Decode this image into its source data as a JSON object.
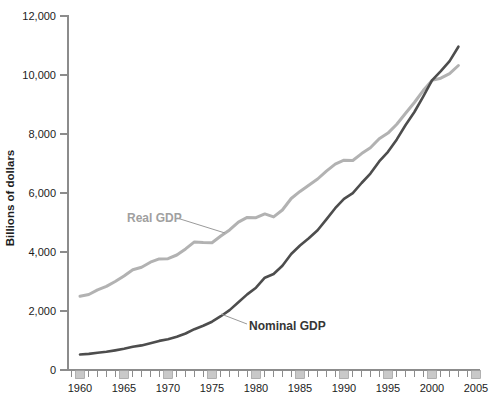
{
  "figure": {
    "real_label": "Real GDP",
    "nominal_label": "Nominal GDP"
  },
  "colors": {
    "real_line": "#b2b2b2",
    "nominal_line": "#4d4d4d",
    "real_label_text": "#a0a0a0",
    "nominal_label_text": "#363636",
    "axis": "#8c8c8c",
    "tick_text": "#1c1c1c",
    "marker_box_fill": "#c9c9c9",
    "marker_box_stroke": "#999999",
    "leader_line": "#9a9a9a"
  },
  "chart_data": {
    "type": "line",
    "title": "",
    "xlabel": "",
    "ylabel": "Billions of dollars",
    "ylim": [
      0,
      12000
    ],
    "x_range": [
      1959,
      2005
    ],
    "grid": false,
    "legend_position": "inline-annotations",
    "y_ticks": [
      0,
      2000,
      4000,
      6000,
      8000,
      10000,
      12000
    ],
    "y_tick_labels": [
      "0",
      "2,000",
      "4,000",
      "6,000",
      "8,000",
      "10,000",
      "12,000"
    ],
    "x_tick_years": [
      1960,
      1965,
      1970,
      1975,
      1980,
      1985,
      1990,
      1995,
      2000,
      2005
    ],
    "x_tick_labels": [
      "1960",
      "1965",
      "1970",
      "1975",
      "1980",
      "1985",
      "1990",
      "1995",
      "2000",
      "2005"
    ],
    "years": [
      1960,
      1961,
      1962,
      1963,
      1964,
      1965,
      1966,
      1967,
      1968,
      1969,
      1970,
      1971,
      1972,
      1973,
      1974,
      1975,
      1976,
      1977,
      1978,
      1979,
      1980,
      1981,
      1982,
      1983,
      1984,
      1985,
      1986,
      1987,
      1988,
      1989,
      1990,
      1991,
      1992,
      1993,
      1994,
      1995,
      1996,
      1997,
      1998,
      1999,
      2000,
      2001,
      2002,
      2003
    ],
    "series": [
      {
        "name": "Real GDP",
        "color": "#b2b2b2",
        "values": [
          2502,
          2560,
          2715,
          2834,
          2999,
          3191,
          3399,
          3485,
          3653,
          3765,
          3772,
          3899,
          4105,
          4342,
          4320,
          4311,
          4541,
          4750,
          5015,
          5173,
          5162,
          5292,
          5189,
          5424,
          5814,
          6054,
          6264,
          6475,
          6743,
          6981,
          7113,
          7101,
          7337,
          7533,
          7836,
          8032,
          8329,
          8704,
          9067,
          9470,
          9817,
          9891,
          10049,
          10321
        ]
      },
      {
        "name": "Nominal GDP",
        "color": "#4d4d4d",
        "values": [
          526,
          545,
          586,
          618,
          664,
          719,
          788,
          833,
          910,
          985,
          1039,
          1127,
          1238,
          1383,
          1500,
          1638,
          1825,
          2031,
          2295,
          2563,
          2790,
          3128,
          3255,
          3537,
          3933,
          4220,
          4463,
          4739,
          5104,
          5484,
          5803,
          5996,
          6338,
          6657,
          7072,
          7398,
          7817,
          8304,
          8747,
          9268,
          9817,
          10128,
          10470,
          10961
        ]
      }
    ]
  }
}
